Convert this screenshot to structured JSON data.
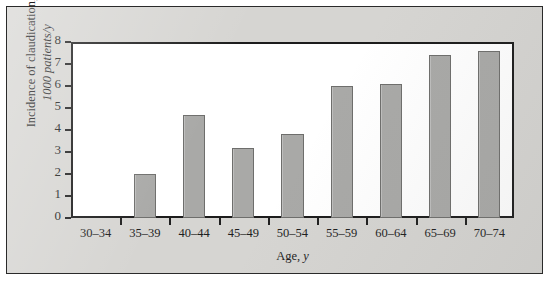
{
  "figure": {
    "panel_color": "#d6d5d2",
    "plot_background": "#ffffff",
    "bar_color": "#a9a9a7",
    "bar_border_color": "#6e6e6c",
    "axis_color": "#1f1f1f"
  },
  "axis_titles": {
    "y_line1": "Incidence of claudication,",
    "y_line2": "1000 patients/y",
    "x_line1": "Age, ",
    "x_unit": "y"
  },
  "chart_data": {
    "type": "bar",
    "title": "",
    "xlabel": "Age, y",
    "ylabel": "Incidence of claudication, 1000 patients/y",
    "categories": [
      "30–34",
      "35–39",
      "40–44",
      "45–49",
      "50–54",
      "55–59",
      "60–64",
      "65–69",
      "70–74"
    ],
    "values": [
      0,
      2.0,
      4.7,
      3.2,
      3.8,
      6.0,
      6.1,
      7.4,
      7.6
    ],
    "ylim": [
      0,
      8
    ],
    "yticks": [
      0,
      1,
      2,
      3,
      4,
      5,
      6,
      7,
      8
    ],
    "ytick_labels": [
      "0",
      "1",
      "2",
      "3",
      "4",
      "5",
      "6",
      "7",
      "8"
    ],
    "grid": false,
    "legend": null
  }
}
